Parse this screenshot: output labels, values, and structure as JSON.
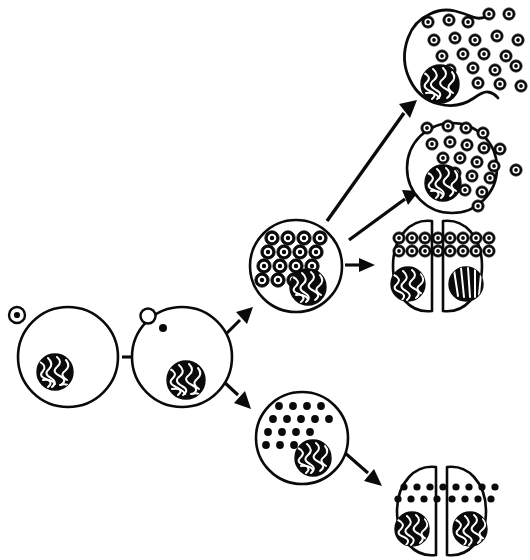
{
  "figure": {
    "title": "Viral infection pathways: productive (lytic) and latent (proviral) outcomes",
    "type": "biological-process-diagram",
    "canvas": {
      "width": 530,
      "height": 560
    },
    "background_color": "#ffffff",
    "ink_color": "#0a0a0a",
    "style": "black-and-white line drawing"
  },
  "legend_semantics": {
    "ring_symbol": "enveloped virion (dark ring with white annulus and dark core)",
    "solid_dot_symbol": "integrated provirus / non-assembled viral genome copy",
    "nucleus_symbol": "dark circle with white squiggled chromatin",
    "cell_symbol": "white circle with thick black membrane"
  },
  "stages": [
    {
      "id": "stage-1",
      "name": "virion-attachment",
      "label": "Free virion attached to host cell surface",
      "shape": "circle",
      "cx": 68,
      "cy": 357,
      "r": 50,
      "nucleus": {
        "cx": 55,
        "cy": 372,
        "r": 18
      },
      "particles": {
        "kind": "ring",
        "count": 0
      },
      "attached_virion": {
        "cx": 17,
        "cy": 315,
        "r": 8
      }
    },
    {
      "id": "stage-2",
      "name": "virion-entry",
      "label": "Viral genome released into cytoplasm; empty capsid at membrane",
      "shape": "circle",
      "cx": 182,
      "cy": 357,
      "r": 50,
      "nucleus": {
        "cx": 186,
        "cy": 380,
        "r": 19
      },
      "particles": {
        "kind": "dot",
        "count": 1
      },
      "empty_capsid": {
        "cx": 148,
        "cy": 316,
        "r": 8
      },
      "internal_dot": {
        "cx": 163,
        "cy": 328,
        "r": 4
      }
    },
    {
      "id": "stage-3a",
      "name": "productive-replication",
      "label": "Productive infection: progeny virions assembled in cytoplasm",
      "shape": "circle",
      "cx": 296,
      "cy": 266,
      "r": 46,
      "nucleus": {
        "cx": 308,
        "cy": 287,
        "r": 18
      },
      "particles": {
        "kind": "ring",
        "count": 16,
        "layout": "4x4-rhombus"
      }
    },
    {
      "id": "stage-3b",
      "name": "latent-infection",
      "label": "Latent infection: viral genomes present, no virion assembly",
      "shape": "circle",
      "cx": 302,
      "cy": 438,
      "r": 46,
      "nucleus": {
        "cx": 313,
        "cy": 458,
        "r": 18
      },
      "particles": {
        "kind": "dot",
        "count": 17,
        "layout": "4-rows-rhombus"
      }
    },
    {
      "id": "stage-4",
      "name": "budding-release",
      "label": "Virions bud and escape through the cell membrane",
      "shape": "circle",
      "cx": 452,
      "cy": 168,
      "r": 45,
      "nucleus": {
        "cx": 443,
        "cy": 183,
        "r": 18
      },
      "particles": {
        "kind": "ring",
        "count": 20,
        "layout": "clustered-right-escaping"
      }
    },
    {
      "id": "stage-5",
      "name": "cell-lysis",
      "label": "Cell lysis: membrane ruptures and releases all virions",
      "shape": "circle-open",
      "cx": 458,
      "cy": 56,
      "r": 46,
      "nucleus": {
        "cx": 440,
        "cy": 84,
        "r": 19
      },
      "particles": {
        "kind": "ring",
        "count": 21,
        "layout": "scattered-escaping"
      },
      "membrane_state": "ruptured-wavy-opening"
    },
    {
      "id": "stage-6",
      "name": "division-with-virions",
      "label": "Infected cell divides; each daughter inherits assembled virions",
      "shape": "daughter-pair",
      "left": {
        "cx": 408,
        "cy": 266,
        "rx": 24,
        "ry": 46,
        "nucleus": {
          "cx": 408,
          "cy": 284,
          "r": 17
        },
        "particles": {
          "kind": "ring",
          "count": 8,
          "layout": "2-rows-of-4"
        }
      },
      "right": {
        "cx": 466,
        "cy": 266,
        "rx": 24,
        "ry": 46,
        "nucleus": {
          "cx": 466,
          "cy": 284,
          "r": 17
        },
        "particles": {
          "kind": "ring",
          "count": 8,
          "layout": "2-rows-of-4"
        }
      }
    },
    {
      "id": "stage-7",
      "name": "division-with-provirus",
      "label": "Latently infected cell divides; each daughter inherits proviral genomes",
      "shape": "daughter-pair",
      "left": {
        "cx": 412,
        "cy": 511,
        "rx": 24,
        "ry": 45,
        "nucleus": {
          "cx": 412,
          "cy": 529,
          "r": 17
        },
        "particles": {
          "kind": "dot",
          "count": 10,
          "layout": "2-rows-of-5"
        }
      },
      "right": {
        "cx": 470,
        "cy": 511,
        "rx": 24,
        "ry": 45,
        "nucleus": {
          "cx": 470,
          "cy": 529,
          "r": 17
        },
        "particles": {
          "kind": "dot",
          "count": 10,
          "layout": "2-rows-of-5"
        }
      }
    }
  ],
  "arrows": [
    {
      "id": "arrow-1",
      "name": "arrow-stage1-to-stage2",
      "from": "stage-1",
      "to": "stage-2",
      "x1": 124,
      "y1": 357,
      "x2": 130,
      "y2": 357,
      "direction": "right",
      "length": "short"
    },
    {
      "id": "arrow-2",
      "name": "arrow-stage2-to-stage3a",
      "from": "stage-2",
      "to": "stage-3a",
      "x1": 228,
      "y1": 330,
      "x2": 247,
      "y2": 309,
      "direction": "up-right",
      "length": "short"
    },
    {
      "id": "arrow-3",
      "name": "arrow-stage2-to-stage3b",
      "from": "stage-2",
      "to": "stage-3b",
      "x1": 224,
      "y1": 383,
      "x2": 250,
      "y2": 404,
      "direction": "down-right",
      "length": "short"
    },
    {
      "id": "arrow-4",
      "name": "arrow-stage3a-to-lysis",
      "from": "stage-3a",
      "to": "stage-5",
      "x1": 329,
      "y1": 219,
      "x2": 411,
      "y2": 104,
      "direction": "up-right",
      "length": "long"
    },
    {
      "id": "arrow-5",
      "name": "arrow-stage3a-to-budding",
      "from": "stage-3a",
      "to": "stage-4",
      "x1": 350,
      "y1": 237,
      "x2": 412,
      "y2": 192,
      "direction": "up-right",
      "length": "long"
    },
    {
      "id": "arrow-6",
      "name": "arrow-stage3a-to-division",
      "from": "stage-3a",
      "to": "stage-6",
      "x1": 344,
      "y1": 265,
      "x2": 374,
      "y2": 265,
      "direction": "right",
      "length": "short"
    },
    {
      "id": "arrow-7",
      "name": "arrow-stage3b-to-division",
      "from": "stage-3b",
      "to": "stage-7",
      "x1": 345,
      "y1": 455,
      "x2": 383,
      "y2": 486,
      "direction": "down-right",
      "length": "short"
    }
  ]
}
